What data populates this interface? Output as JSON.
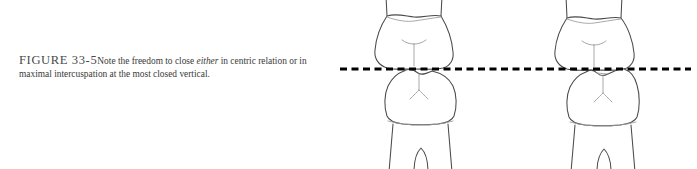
{
  "figure": {
    "label": "FIGURE 33-5",
    "caption_text": "Note the freedom to close ",
    "caption_emphasis": "either",
    "caption_text_2": " in centric relation or in maximal intercuspation at the most closed vertical.",
    "caption_full": "FIGURE 33-5 Note the freedom to close either in centric relation or in maximal intercuspation at the most closed vertical."
  },
  "illustration": {
    "description": "Two side-by-side line drawings of opposing upper and lower posterior teeth meeting at a horizontal dashed occlusal plane",
    "panels": [
      {
        "name": "centric-relation",
        "position": "left",
        "upper_tooth": "maxillary-posterior-tooth",
        "lower_tooth": "mandibular-posterior-tooth",
        "contact": "cusp-to-fossa"
      },
      {
        "name": "maximal-intercuspation",
        "position": "right",
        "upper_tooth": "maxillary-posterior-tooth",
        "lower_tooth": "mandibular-posterior-tooth",
        "contact": "shifted-interdigitated"
      }
    ],
    "occlusal_plane": {
      "name": "closed-vertical-dimension-line",
      "style": "dashed",
      "y": 69
    }
  },
  "colors": {
    "background": "#ffffff",
    "caption_label": "#4a4a4a",
    "caption_body": "#3a3a3a",
    "tooth_outline": "#4a4a4a",
    "tooth_fill": "#ffffff",
    "groove_line": "#9a9a9a",
    "dash_line": "#000000"
  }
}
